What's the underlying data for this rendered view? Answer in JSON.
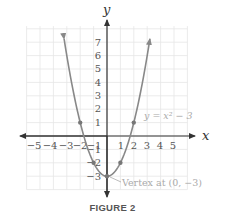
{
  "chart_data": {
    "type": "line",
    "title": "",
    "caption": "FIGURE 2",
    "xlabel": "x",
    "ylabel": "y",
    "xlim": [
      -6,
      6
    ],
    "ylim": [
      -4,
      8
    ],
    "grid": true,
    "x_ticks": [
      -5,
      -4,
      -3,
      -2,
      -1,
      1,
      2,
      3,
      4,
      5
    ],
    "y_ticks": [
      -3,
      -2,
      -1,
      1,
      2,
      3,
      4,
      5,
      6,
      7
    ],
    "series": [
      {
        "name": "y = x^2 - 3",
        "function": "x^2 - 3",
        "domain": [
          -3.2,
          3.2
        ],
        "points": [
          {
            "x": -2,
            "y": 1
          },
          {
            "x": -1,
            "y": -2
          },
          {
            "x": 0,
            "y": -3
          },
          {
            "x": 1,
            "y": -2
          },
          {
            "x": 2,
            "y": 1
          }
        ],
        "color": "#888888"
      }
    ],
    "annotations": [
      {
        "text": "y = x² − 3",
        "near": {
          "x": 3,
          "y": 1.5
        }
      },
      {
        "text": "Vertex at (0, −3)",
        "points_to": {
          "x": 0,
          "y": -3
        }
      }
    ]
  },
  "labels": {
    "x_axis": "x",
    "y_axis": "y",
    "equation": "y = x² − 3",
    "vertex": "Vertex at (0, −3)",
    "figure": "FIGURE 2",
    "x_ticks": [
      "−5",
      "−4",
      "−3",
      "−2",
      "−1",
      "1",
      "2",
      "3",
      "4",
      "5"
    ],
    "y_ticks_pos": [
      "1",
      "2",
      "3",
      "4",
      "5",
      "6",
      "7"
    ],
    "y_ticks_neg": [
      "−1",
      "−2",
      "−3"
    ]
  }
}
